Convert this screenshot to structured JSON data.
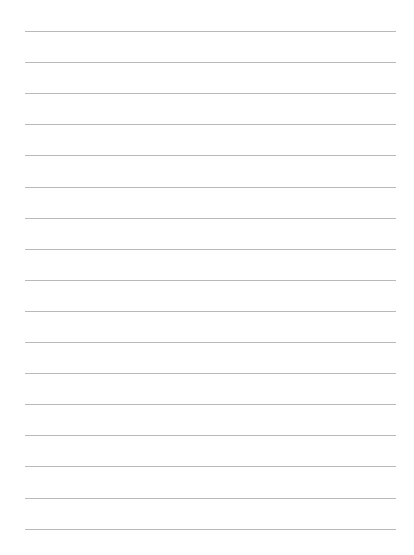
{
  "page": {
    "type": "lined-paper",
    "line_color": "#b9b9b9",
    "line_count": 17,
    "line_left": 25,
    "line_right": 396,
    "first_line_y": 31,
    "line_spacing": 31.1,
    "lines": [
      "",
      "",
      "",
      "",
      "",
      "",
      "",
      "",
      "",
      "",
      "",
      "",
      "",
      "",
      "",
      "",
      ""
    ]
  }
}
